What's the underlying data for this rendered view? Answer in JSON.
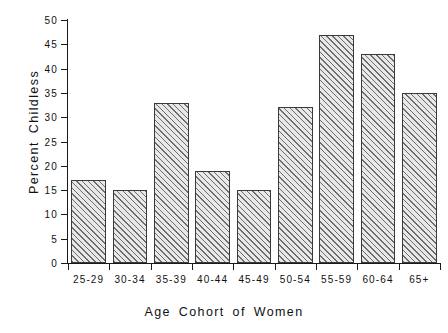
{
  "chart_data": {
    "type": "bar",
    "title": "",
    "subtitle": "",
    "xlabel": "Age Cohort of Women",
    "ylabel": "Percent Childless",
    "categories": [
      "25-29",
      "30-34",
      "35-39",
      "40-44",
      "45-49",
      "50-54",
      "55-59",
      "60-64",
      "65+"
    ],
    "values": [
      17,
      15,
      33,
      19,
      15,
      32,
      47,
      43,
      35
    ],
    "ylim": [
      0,
      50
    ],
    "ytick_values": [
      0,
      5,
      10,
      15,
      20,
      25,
      30,
      35,
      40,
      45,
      50
    ],
    "ytick_labels": [
      "0",
      "5",
      "10",
      "15",
      "20",
      "25",
      "30",
      "35",
      "40",
      "45",
      "50"
    ],
    "grid": false,
    "legend": null,
    "legend_position": "none",
    "annotations": [],
    "bar_fill": "diagonal-hatch",
    "colors": {
      "bar_fill": "#e8e8e8",
      "bar_hatch": "#6d6d6d",
      "bar_edge": "#3a3a3a",
      "axis": "#1a1a1a",
      "text": "#111111",
      "background": "#ffffff"
    }
  }
}
